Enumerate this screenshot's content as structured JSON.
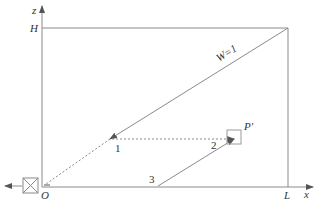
{
  "diagram": {
    "axes": {
      "vertical_label": "z",
      "horizontal_label": "x",
      "origin_label": "O",
      "height_label": "H",
      "length_label": "L"
    },
    "lines": {
      "diagonal_label": "W=1"
    },
    "points": {
      "p1_label": "1",
      "p2_label": "2",
      "p3_label": "3",
      "target_label": "P'"
    },
    "colors": {
      "line": "#8a8a8a",
      "text": "#333333",
      "background": "#ffffff"
    }
  }
}
